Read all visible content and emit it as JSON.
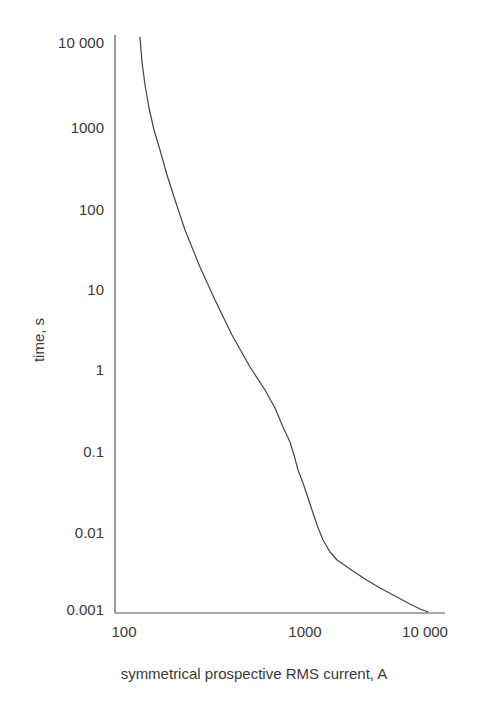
{
  "chart_data": {
    "type": "line",
    "title": "",
    "xlabel": "symmetrical prospective RMS current, A",
    "ylabel": "time, s",
    "xscale": "log",
    "yscale": "log",
    "xlim": [
      100,
      10000
    ],
    "ylim": [
      0.001,
      10000
    ],
    "grid": false,
    "legend": null,
    "x_tick_labels": [
      "100",
      "1000",
      "10 000"
    ],
    "y_tick_labels": [
      "10 000",
      "1000",
      "100",
      "10",
      "1",
      "0.1",
      "0.01",
      "0.001"
    ],
    "series": [
      {
        "name": "time-current characteristic",
        "x": [
          121,
          135,
          160,
          190,
          240,
          300,
          390,
          520,
          650,
          755,
          880,
          977,
          1150,
          1400,
          1850,
          2600,
          3600,
          5100,
          7500,
          10600
        ],
        "y": [
          10000,
          3000,
          600,
          115,
          35,
          12,
          3.0,
          0.9,
          0.35,
          0.18,
          0.07,
          0.027,
          0.011,
          0.006,
          0.0042,
          0.003,
          0.0022,
          0.0016,
          0.0012,
          0.001
        ]
      }
    ]
  },
  "axes": {
    "y_ticks": [
      {
        "label": "10 000",
        "y": 43
      },
      {
        "label": "1000",
        "y": 128
      },
      {
        "label": "100",
        "y": 210
      },
      {
        "label": "10",
        "y": 290
      },
      {
        "label": "1",
        "y": 370
      },
      {
        "label": "0.1",
        "y": 452
      },
      {
        "label": "0.01",
        "y": 533
      },
      {
        "label": "0.001",
        "y": 610
      }
    ],
    "x_ticks": [
      {
        "label": "100",
        "x": 124
      },
      {
        "label": "1000",
        "x": 305
      },
      {
        "label": "10 000",
        "x": 425
      }
    ],
    "xlabel": "symmetrical prospective RMS current, A",
    "ylabel": "time, s"
  },
  "curve_points": "140,37 142,62 145,85 149,108 154,130 160,150 167,175 175,200 185,230 200,267 215,300 232,335 250,367 265,390 275,408 283,427 290,442 294,455 298,470 303,483 308,498 312,510 317,525 323,540 330,552 337,560 350,569 365,579 380,588 395,596 410,604 420,609 428,612",
  "colors": {
    "line": "#444444",
    "axis": "#555555",
    "text": "#3a3a3a"
  }
}
